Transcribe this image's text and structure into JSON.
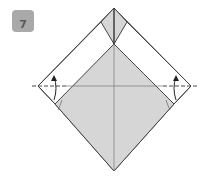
{
  "step": {
    "number": "7"
  },
  "diagram": {
    "colors": {
      "paper_front": "#d6d6d6",
      "paper_back": "#ffffff",
      "line": "#444444",
      "badge": "#a9a9a9"
    },
    "icons": [
      "valley-fold-line-left",
      "fold-arrow-left",
      "valley-fold-line-right",
      "fold-arrow-right"
    ]
  }
}
